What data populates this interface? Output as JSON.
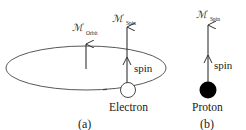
{
  "diagram": {
    "panels": [
      {
        "id": "a",
        "caption": "(a)",
        "particle_label": "Electron",
        "spin_label": "spin",
        "moments": [
          {
            "symbol": "ℳ",
            "subscript": "Orbit"
          },
          {
            "symbol": "ℳ",
            "subscript": "Spin"
          }
        ],
        "orbit": "ellipse"
      },
      {
        "id": "b",
        "caption": "(b)",
        "particle_label": "Proton",
        "spin_label": "spin",
        "moments": [
          {
            "symbol": "ℳ",
            "subscript": "Spin"
          }
        ]
      }
    ],
    "colors": {
      "stroke": "#333333",
      "proton_fill": "#000000",
      "electron_fill": "#ffffff",
      "background": "#ffffff"
    }
  }
}
